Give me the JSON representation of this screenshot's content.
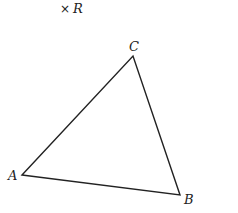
{
  "diagram": {
    "type": "geometry",
    "point_R": {
      "label": "R",
      "x": 65,
      "y": 8,
      "marker": "×"
    },
    "triangle": {
      "vertices": [
        {
          "label": "A",
          "x": 22,
          "y": 175
        },
        {
          "label": "B",
          "x": 180,
          "y": 195
        },
        {
          "label": "C",
          "x": 133,
          "y": 56
        }
      ],
      "stroke": "#222222"
    }
  }
}
